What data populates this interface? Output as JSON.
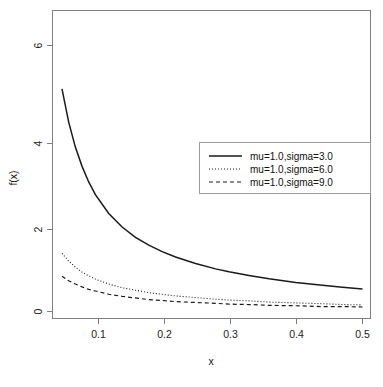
{
  "chart_data": {
    "type": "line",
    "title": "",
    "xlabel": "x",
    "ylabel": "f(x)",
    "xlim": [
      0.04,
      0.5
    ],
    "ylim": [
      0,
      6.9
    ],
    "xticks": [
      0.1,
      0.2,
      0.3,
      0.4,
      0.5
    ],
    "xtick_labels": [
      "0.1",
      "0.2",
      "0.3",
      "0.4",
      "0.5"
    ],
    "yticks": [
      0,
      2,
      4,
      6
    ],
    "ytick_labels": [
      "0",
      "2",
      "4",
      "6"
    ],
    "grid": false,
    "legend_position": "center-right",
    "series": [
      {
        "name": "mu=1.0,sigma=3.0",
        "linestyle": "solid",
        "color": "#1a1a1a",
        "x": [
          0.04,
          0.05,
          0.06,
          0.07,
          0.08,
          0.09,
          0.1,
          0.12,
          0.14,
          0.16,
          0.18,
          0.2,
          0.22,
          0.25,
          0.28,
          0.3,
          0.33,
          0.36,
          0.4,
          0.44,
          0.47,
          0.5
        ],
        "y": [
          6.4,
          5.43,
          4.62,
          4.01,
          3.54,
          3.16,
          2.85,
          2.39,
          2.06,
          1.81,
          1.62,
          1.46,
          1.33,
          1.17,
          1.04,
          0.97,
          0.88,
          0.8,
          0.71,
          0.64,
          0.59,
          0.55
        ]
      },
      {
        "name": "mu=1.0,sigma=6.0",
        "linestyle": "dotted",
        "color": "#1a1a1a",
        "x": [
          0.04,
          0.05,
          0.06,
          0.07,
          0.08,
          0.09,
          0.1,
          0.12,
          0.14,
          0.16,
          0.18,
          0.2,
          0.22,
          0.25,
          0.28,
          0.3,
          0.33,
          0.36,
          0.4,
          0.44,
          0.47,
          0.5
        ],
        "y": [
          1.66,
          1.42,
          1.23,
          1.08,
          0.96,
          0.87,
          0.79,
          0.67,
          0.58,
          0.52,
          0.46,
          0.42,
          0.38,
          0.34,
          0.3,
          0.28,
          0.26,
          0.23,
          0.21,
          0.19,
          0.17,
          0.16
        ]
      },
      {
        "name": "mu=1.0,sigma=9.0",
        "linestyle": "dashed",
        "color": "#1a1a1a",
        "x": [
          0.04,
          0.05,
          0.06,
          0.07,
          0.08,
          0.09,
          0.1,
          0.12,
          0.14,
          0.16,
          0.18,
          0.2,
          0.22,
          0.25,
          0.28,
          0.3,
          0.33,
          0.36,
          0.4,
          0.44,
          0.47,
          0.5
        ],
        "y": [
          0.99,
          0.86,
          0.75,
          0.67,
          0.6,
          0.54,
          0.5,
          0.42,
          0.37,
          0.33,
          0.29,
          0.27,
          0.24,
          0.22,
          0.2,
          0.18,
          0.17,
          0.15,
          0.14,
          0.12,
          0.12,
          0.11
        ]
      }
    ]
  },
  "legend": {
    "entries": [
      {
        "label": "mu=1.0,sigma=3.0",
        "style": "solid"
      },
      {
        "label": "mu=1.0,sigma=6.0",
        "style": "dotted"
      },
      {
        "label": "mu=1.0,sigma=9.0",
        "style": "dashed"
      }
    ]
  }
}
